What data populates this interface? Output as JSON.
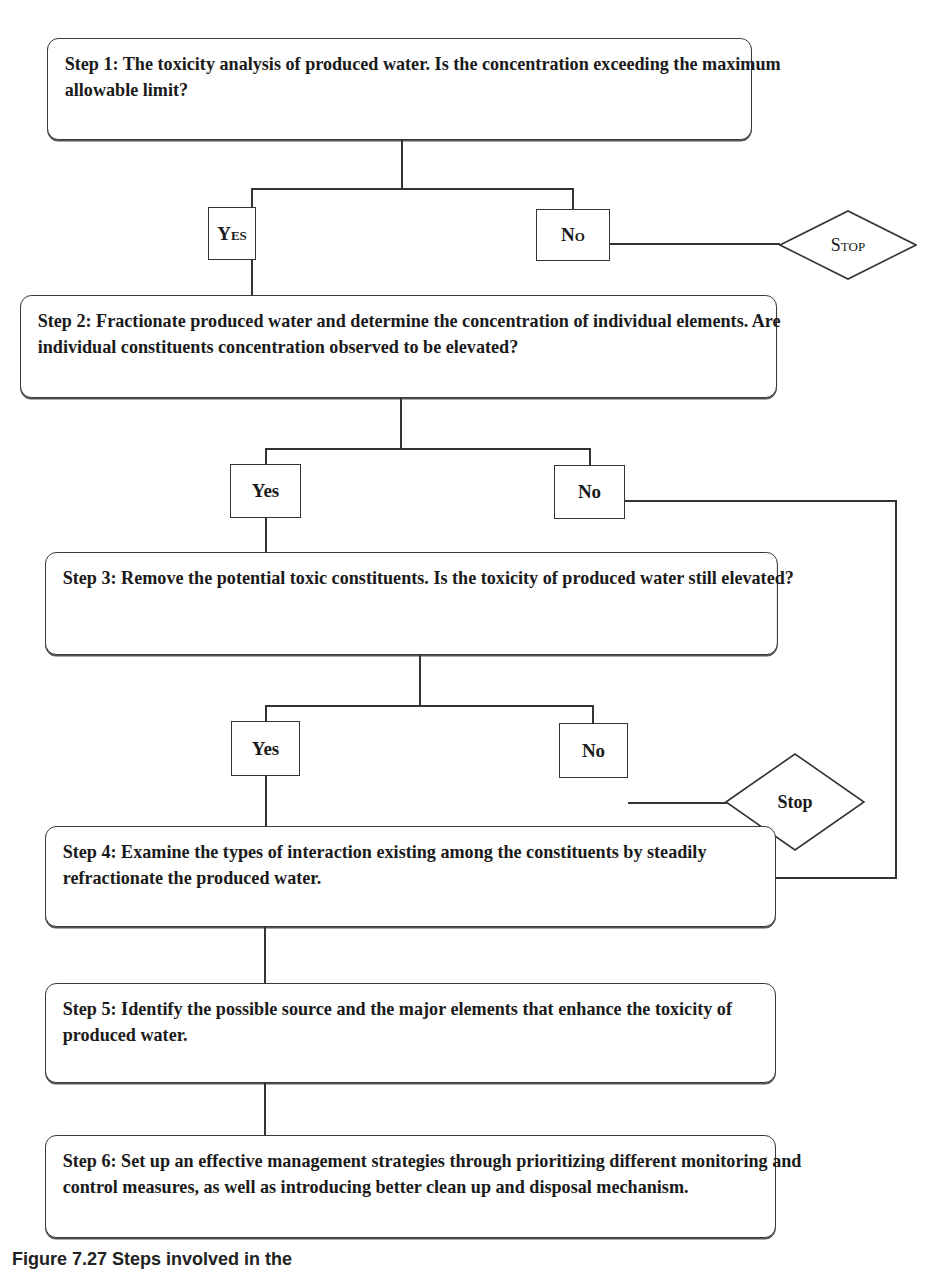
{
  "flowchart": {
    "steps": [
      {
        "id": "step-1",
        "text": "Step 1: The toxicity analysis of produced water. Is the concentration exceeding the maximum allowable limit?"
      },
      {
        "id": "step-2",
        "text": "Step 2: Fractionate produced water and determine the concentration of individual elements. Are individual constituents concentration observed to be elevated?"
      },
      {
        "id": "step-3",
        "text": "Step 3: Remove the potential toxic constituents. Is the toxicity of produced water still elevated?"
      },
      {
        "id": "step-4",
        "text": "Step 4: Examine the types of interaction existing among the constituents by steadily refractionate the produced water."
      },
      {
        "id": "step-5",
        "text": "Step 5: Identify the possible source and the major elements that enhance the toxicity of produced water."
      },
      {
        "id": "step-6",
        "text": "Step 6: Set up an effective management strategies through prioritizing different monitoring and control measures, as well as introducing better clean up and disposal mechanism."
      }
    ],
    "decisions": [
      {
        "after": "step-1",
        "yes": "Yes",
        "no": "No",
        "no_target": "Stop",
        "yes_target": "step-2"
      },
      {
        "after": "step-2",
        "yes": "Yes",
        "no": "No",
        "no_target": "step-4",
        "yes_target": "step-3"
      },
      {
        "after": "step-3",
        "yes": "Yes",
        "no": "No",
        "no_target": "Stop",
        "yes_target": "step-4"
      }
    ],
    "stop_1": "Stop",
    "stop_2": "Stop"
  },
  "caption": "Figure 7.27 Steps involved in the"
}
